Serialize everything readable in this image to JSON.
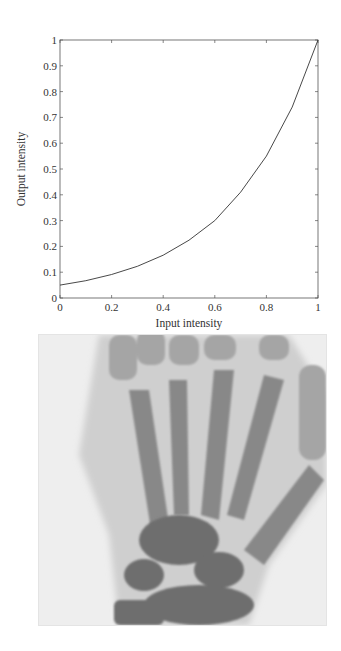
{
  "chart_data": {
    "type": "line",
    "title": "",
    "xlabel": "Input intensity",
    "ylabel": "Output intensity",
    "xlim": [
      0,
      1
    ],
    "ylim": [
      0,
      1
    ],
    "grid": false,
    "legend": null,
    "x_ticks": [
      "0",
      "0.2",
      "0.4",
      "0.6",
      "0.8",
      "1"
    ],
    "y_ticks": [
      "0",
      "0.1",
      "0.2",
      "0.3",
      "0.4",
      "0.5",
      "0.6",
      "0.7",
      "0.8",
      "0.9",
      "1"
    ],
    "series": [
      {
        "name": "intensity transformation",
        "x": [
          0,
          0.1,
          0.2,
          0.3,
          0.4,
          0.5,
          0.6,
          0.7,
          0.8,
          0.9,
          1.0
        ],
        "y": [
          0.05,
          0.067,
          0.091,
          0.123,
          0.166,
          0.224,
          0.3,
          0.41,
          0.55,
          0.74,
          1.0
        ]
      }
    ]
  },
  "image": {
    "description": "Hand X-ray (negative display)"
  }
}
